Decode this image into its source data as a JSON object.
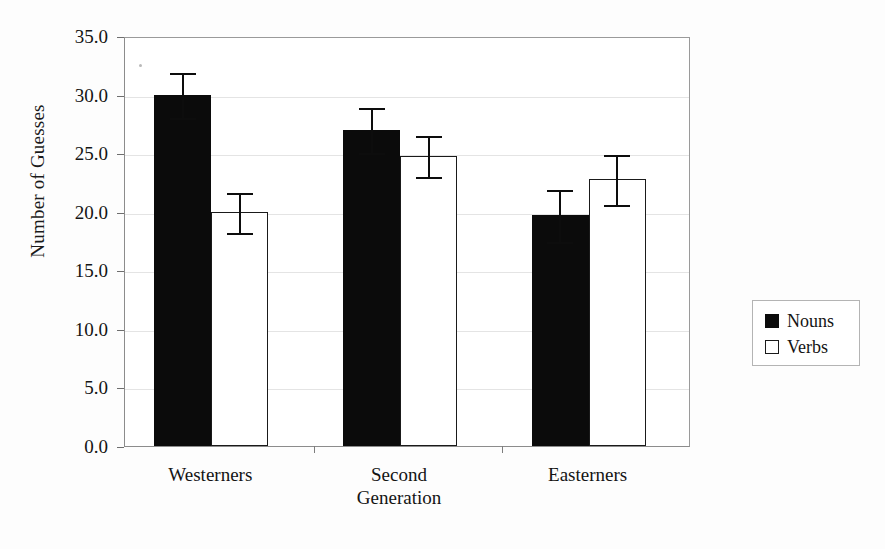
{
  "chart_data": {
    "type": "bar",
    "title": "",
    "xlabel": "",
    "ylabel": "Number of Guesses",
    "categories": [
      "Westerners",
      "Second Generation",
      "Easterners"
    ],
    "category_lines": [
      [
        "Westerners"
      ],
      [
        "Second",
        "Generation"
      ],
      [
        "Easterners"
      ]
    ],
    "ylim": [
      0.0,
      35.0
    ],
    "ytick_step": 5.0,
    "ytick_labels": [
      "0.0",
      "5.0",
      "10.0",
      "15.0",
      "20.0",
      "25.0",
      "30.0",
      "35.0"
    ],
    "ytick_values": [
      0.0,
      5.0,
      10.0,
      15.0,
      20.0,
      25.0,
      30.0,
      35.0
    ],
    "grid": true,
    "legend_position": "right-outside",
    "series": [
      {
        "name": "Nouns",
        "color": "#0b0b0b",
        "style": "filled",
        "values": [
          30.0,
          27.0,
          19.7
        ],
        "errors": [
          2.0,
          2.0,
          2.3
        ]
      },
      {
        "name": "Verbs",
        "color": "#ffffff",
        "style": "hollow",
        "values": [
          20.0,
          24.8,
          22.8
        ],
        "errors": [
          1.8,
          1.8,
          2.2
        ]
      }
    ]
  },
  "legend": {
    "entries": [
      {
        "label": "Nouns",
        "swatch": "filled-square-icon"
      },
      {
        "label": "Verbs",
        "swatch": "hollow-square-icon"
      }
    ]
  }
}
